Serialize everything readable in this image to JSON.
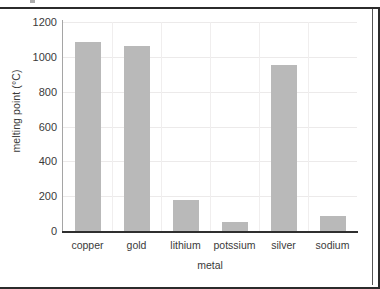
{
  "chart_data": {
    "type": "bar",
    "title": "",
    "xlabel": "metal",
    "ylabel": "melting point (°C)",
    "categories": [
      "copper",
      "gold",
      "lithium",
      "potssium",
      "silver",
      "sodium"
    ],
    "values": [
      1085,
      1065,
      180,
      50,
      955,
      85
    ],
    "ylim": [
      0,
      1200
    ],
    "ytick_labels": [
      "1200",
      "1000",
      "800",
      "600",
      "400",
      "200",
      "0"
    ],
    "ytick_values": [
      1200,
      1000,
      800,
      600,
      400,
      200,
      0
    ],
    "grid": "horizontal-and-vertical-faint",
    "legend": "none",
    "bar_color": "#b9b9b9",
    "axis_color": "#2f2f2f",
    "gridline_color": "#eceaea",
    "text_color": "#3a3a3a"
  },
  "figure": {
    "border_color": "#2b2b2b",
    "background": "#ffffff"
  }
}
